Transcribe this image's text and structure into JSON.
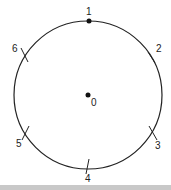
{
  "diagram": {
    "center": {
      "label": "0",
      "x": 88,
      "y": 95
    },
    "radius": 74,
    "stroke_color": "#222222",
    "points": [
      {
        "id": "p1",
        "label": "1",
        "type": "dot"
      },
      {
        "id": "p2",
        "label": "2",
        "type": "tick"
      },
      {
        "id": "p3",
        "label": "3",
        "type": "tick"
      },
      {
        "id": "p4",
        "label": "4",
        "type": "tick"
      },
      {
        "id": "p5",
        "label": "5",
        "type": "tick"
      },
      {
        "id": "p6",
        "label": "6",
        "type": "tick"
      }
    ]
  },
  "footer_band_color": "#c8c8c8"
}
